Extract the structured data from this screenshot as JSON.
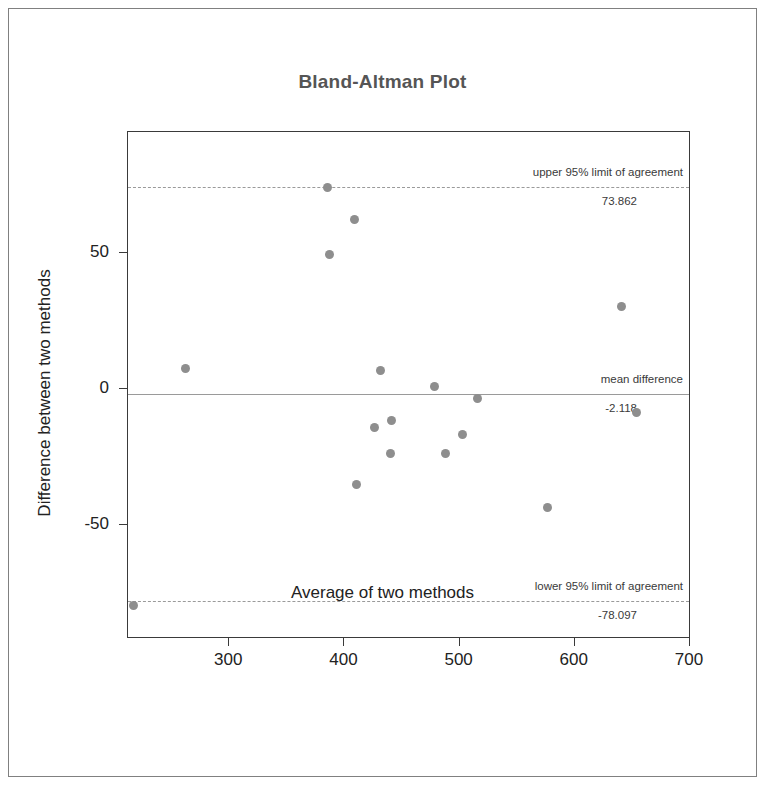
{
  "chart_data": {
    "type": "scatter",
    "title": "Bland-Altman Plot",
    "xlabel": "Average of two methods",
    "ylabel": "Difference between two methods",
    "xlim": [
      213,
      700
    ],
    "ylim": [
      -91.5,
      94
    ],
    "xticks": [
      300,
      400,
      500,
      600,
      700
    ],
    "yticks": [
      50,
      0,
      -50
    ],
    "xtick_labels": [
      "300",
      "400",
      "500",
      "600",
      "700"
    ],
    "ytick_labels": [
      "50",
      "0",
      "-50"
    ],
    "grid": false,
    "legend": "none",
    "marker_color": "#8e8e8e",
    "line_color": "#9a9a9a",
    "frame_color": "#3a3a3a",
    "points": [
      {
        "x": 218,
        "y": -80.0
      },
      {
        "x": 263,
        "y": 7.0
      },
      {
        "x": 386,
        "y": 73.5
      },
      {
        "x": 388,
        "y": 49.0
      },
      {
        "x": 410,
        "y": 62.0
      },
      {
        "x": 411,
        "y": -35.5
      },
      {
        "x": 427,
        "y": -14.5
      },
      {
        "x": 432,
        "y": 6.5
      },
      {
        "x": 442,
        "y": -12.0
      },
      {
        "x": 441,
        "y": -24.0
      },
      {
        "x": 479,
        "y": 0.5
      },
      {
        "x": 489,
        "y": -24.0
      },
      {
        "x": 503,
        "y": -17.0
      },
      {
        "x": 516,
        "y": -4.0
      },
      {
        "x": 577,
        "y": -44.0
      },
      {
        "x": 641,
        "y": 30.0
      },
      {
        "x": 654,
        "y": -9.0
      }
    ],
    "reference_lines": [
      {
        "id": "upper-limit",
        "label": "upper 95% limit of agreement",
        "value": 73.862,
        "value_text": "73.862",
        "style": "dashed"
      },
      {
        "id": "mean-difference",
        "label": "mean difference",
        "value": -2.118,
        "value_text": "-2.118",
        "style": "solid"
      },
      {
        "id": "lower-limit",
        "label": "lower 95% limit of agreement",
        "value": -78.097,
        "value_text": "-78.097",
        "style": "dashed"
      }
    ]
  }
}
